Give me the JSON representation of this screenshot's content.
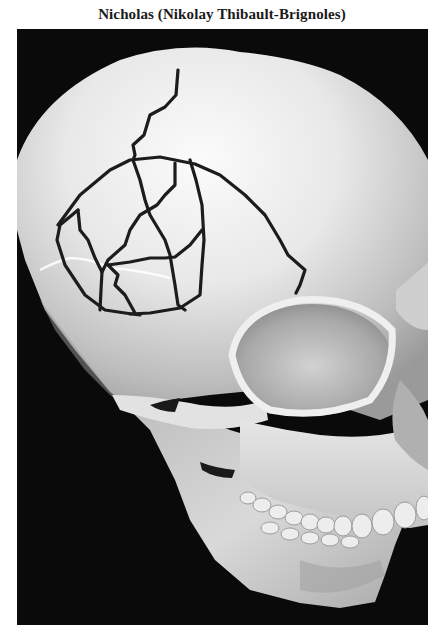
{
  "title": "Nicholas (Nikolay Thibault-Brignoles)",
  "figure": {
    "view": "three-quarter frontal-left",
    "annotation": "fracture-lines drawn on frontal/parietal region",
    "colors": {
      "background": "#0a0a0a",
      "bone_light": "#f2f2f2",
      "bone_mid": "#bdbdbd",
      "bone_shadow": "#7a7a7a",
      "fracture_line": "#1c1c1c"
    }
  }
}
